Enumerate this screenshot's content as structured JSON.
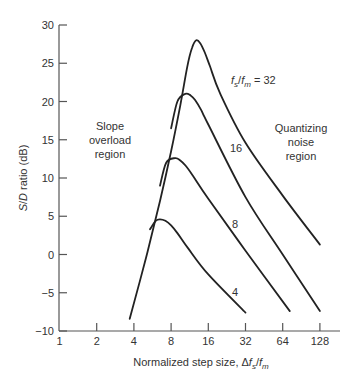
{
  "chart_data": {
    "type": "line",
    "title": "",
    "xlabel": "Normalized step size, Δfₛ/fₘ",
    "ylabel": "S/D ratio (dB)",
    "xscale": "log2",
    "xlim": [
      1,
      128
    ],
    "ylim": [
      -10,
      30
    ],
    "xticks": [
      1,
      2,
      4,
      8,
      16,
      32,
      64,
      128
    ],
    "xtick_labels": [
      "1",
      "2",
      "4",
      "8",
      "16",
      "32",
      "64",
      "128"
    ],
    "yticks": [
      30,
      25,
      20,
      15,
      10,
      5,
      0,
      -5,
      -10
    ],
    "ytick_labels": [
      "30",
      "25",
      "20",
      "15",
      "10",
      "5",
      "0",
      "−5",
      "−10"
    ],
    "grid": false,
    "legend": "inline labels",
    "series": [
      {
        "name": "fs/fm = 32",
        "label": "fₛ/fₘ = 32",
        "x": [
          3.7,
          5.0,
          6.5,
          8.0,
          9.5,
          10.8,
          11.8,
          12.8,
          13.8,
          15.0,
          16.5,
          20,
          32,
          64,
          128
        ],
        "y": [
          -8.4,
          -0.5,
          7.0,
          13.5,
          19.5,
          24.5,
          27.0,
          28.0,
          27.6,
          26.4,
          24.6,
          21.0,
          14.6,
          7.7,
          1.3
        ]
      },
      {
        "name": "fs/fm = 16",
        "label": "16",
        "x": [
          8.0,
          9.0,
          10.4,
          11.5,
          12.5,
          14,
          16,
          32,
          64,
          128
        ],
        "y": [
          16.5,
          20.0,
          21.0,
          20.8,
          20.2,
          18.9,
          17.0,
          7.5,
          0.0,
          -7.4
        ]
      },
      {
        "name": "fs/fm = 8",
        "label": "8",
        "x": [
          6.5,
          7.3,
          8.6,
          9.5,
          10.5,
          12,
          16,
          32,
          73
        ],
        "y": [
          9.0,
          12.0,
          12.6,
          12.3,
          11.6,
          10.3,
          7.3,
          0.5,
          -7.4
        ]
      },
      {
        "name": "fs/fm = 4",
        "label": "4",
        "x": [
          5.4,
          6.0,
          6.5,
          7.2,
          8.0,
          9.0,
          11,
          16,
          32
        ],
        "y": [
          3.3,
          4.4,
          4.6,
          4.4,
          3.8,
          2.8,
          0.8,
          -2.6,
          -7.6
        ]
      }
    ],
    "annotations": [
      {
        "text": "Slope overload region",
        "lines": [
          "Slope",
          "overload",
          "region"
        ]
      },
      {
        "text": "Quantizing noise region",
        "lines": [
          "Quantizing",
          "noise",
          "region"
        ]
      }
    ]
  },
  "labels": {
    "ylabel": "S/D ratio (dB)",
    "xlabel_prefix": "Normalized step size, ",
    "slope_1": "Slope",
    "slope_2": "overload",
    "slope_3": "region",
    "quant_1": "Quantizing",
    "quant_2": "noise",
    "quant_3": "region",
    "curve32": "= 32",
    "curve16": "16",
    "curve8": "8",
    "curve4": "4"
  }
}
